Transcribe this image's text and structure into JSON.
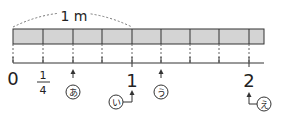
{
  "diagram": {
    "span_label": "1 m",
    "number_labels": {
      "zero": "0",
      "quarter_num": "1",
      "quarter_den": "4",
      "one": "1",
      "two": "2"
    },
    "markers": {
      "a": "あ",
      "i": "い",
      "u": "う",
      "e": "え"
    },
    "colors": {
      "bar_fill": "#d4d4d4",
      "line": "#333333"
    }
  }
}
